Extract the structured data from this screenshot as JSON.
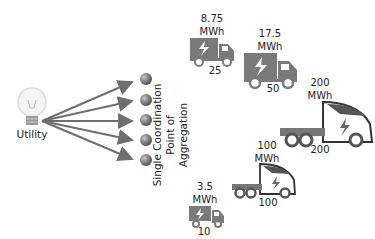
{
  "utility": {
    "label": "Utility"
  },
  "aggregator": {
    "line1": "Single Coordination",
    "line2": "Point of",
    "line3": "Aggregation"
  },
  "fleets": [
    {
      "energy": "8.75",
      "unit": "MWh",
      "count": "25",
      "type": "box-truck-small"
    },
    {
      "energy": "17.5",
      "unit": "MWh",
      "count": "50",
      "type": "box-truck-large"
    },
    {
      "energy": "200",
      "unit": "MWh",
      "count": "200",
      "type": "semi-truck-large"
    },
    {
      "energy": "100",
      "unit": "MWh",
      "count": "100",
      "type": "semi-truck-medium"
    },
    {
      "energy": "3.5",
      "unit": "MWh",
      "count": "10",
      "type": "box-truck-tiny"
    }
  ],
  "colors": {
    "truck": "#7a7a7a",
    "arrow": "#6f6f6f",
    "node": "#8a8a8a",
    "text": "#222222"
  }
}
